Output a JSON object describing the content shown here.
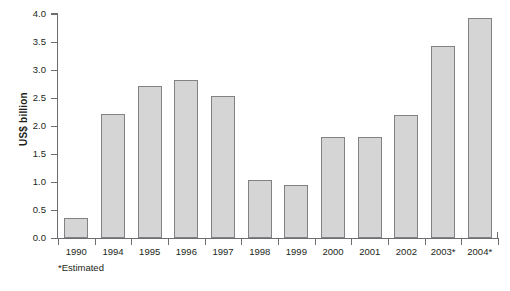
{
  "chart_data": {
    "type": "bar",
    "title": "",
    "xlabel": "",
    "ylabel": "US$ billion",
    "categories": [
      "1990",
      "1994",
      "1995",
      "1996",
      "1997",
      "1998",
      "1999",
      "2000",
      "2001",
      "2002",
      "2003*",
      "2004*"
    ],
    "values": [
      0.36,
      2.21,
      2.71,
      2.83,
      2.54,
      1.04,
      0.95,
      1.8,
      1.8,
      2.19,
      3.43,
      3.93
    ],
    "ylim": [
      0.0,
      4.0
    ],
    "ytick_labels": [
      "4.0",
      "3.5",
      "3.0",
      "2.5",
      "2.0",
      "1.5",
      "1.0",
      "0.5",
      "0.0"
    ],
    "ytick_values": [
      4.0,
      3.5,
      3.0,
      2.5,
      2.0,
      1.5,
      1.0,
      0.5,
      0.0
    ],
    "grid": false,
    "legend": null,
    "annotations": [
      "*Estimated"
    ],
    "bar_color": "#d5d5d5",
    "bar_border_color": "#808285",
    "axis_color": "#6d6e71",
    "text_color": "#231f20"
  },
  "footnote": "*Estimated"
}
